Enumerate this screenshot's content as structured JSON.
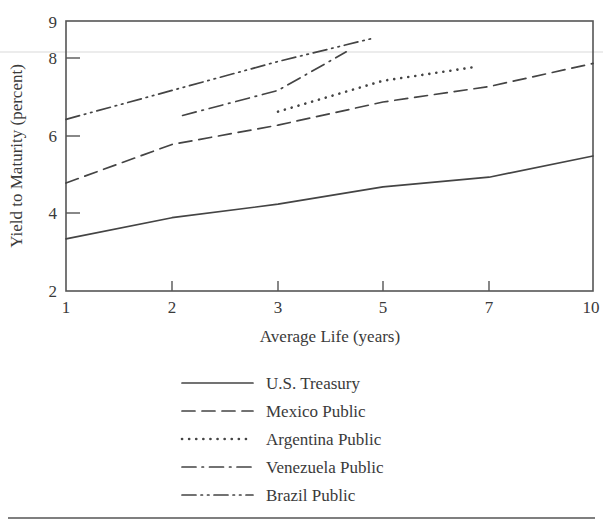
{
  "chart_data": {
    "type": "line",
    "title": "",
    "xlabel": "Average Life (years)",
    "ylabel": "Yield to Maturity (percent)",
    "x_tick_labels": [
      "1",
      "2",
      "3",
      "5",
      "7",
      "10"
    ],
    "x_tick_values": [
      1,
      2,
      3,
      5,
      7,
      10
    ],
    "x_scale": "ordinal-spaced",
    "y_tick_labels": [
      "2",
      "4",
      "6",
      "8",
      "9"
    ],
    "y_tick_values": [
      2,
      4,
      6,
      8,
      9
    ],
    "ylim": [
      2,
      9
    ],
    "grid": false,
    "legend_position": "below-plot",
    "series": [
      {
        "name": "U.S. Treasury",
        "style": "solid",
        "x": [
          1,
          2,
          3,
          5,
          7,
          10
        ],
        "y": [
          3.35,
          3.9,
          4.25,
          4.7,
          4.95,
          5.5
        ]
      },
      {
        "name": "Mexico Public",
        "style": "dashed",
        "x": [
          1,
          2,
          3,
          5,
          7,
          10
        ],
        "y": [
          4.8,
          5.8,
          6.3,
          6.9,
          7.3,
          7.9
        ]
      },
      {
        "name": "Argentina Public",
        "style": "dotted",
        "x": [
          3,
          5,
          6.7
        ],
        "y": [
          6.65,
          7.45,
          7.8
        ]
      },
      {
        "name": "Venezuela Public",
        "style": "dash-dot",
        "x": [
          2.1,
          3,
          4.3
        ],
        "y": [
          6.55,
          7.2,
          8.2
        ]
      },
      {
        "name": "Brazil Public",
        "style": "dash-dot-dot",
        "x": [
          1,
          2,
          3,
          4.8
        ],
        "y": [
          6.45,
          7.2,
          7.95,
          8.55
        ]
      }
    ]
  },
  "legend": {
    "items": [
      {
        "label": "U.S. Treasury",
        "style": "solid"
      },
      {
        "label": "Mexico Public",
        "style": "dashed"
      },
      {
        "label": "Argentina Public",
        "style": "dotted"
      },
      {
        "label": "Venezuela Public",
        "style": "dash-dot"
      },
      {
        "label": "Brazil Public",
        "style": "dash-dot-dot"
      }
    ]
  },
  "axes": {
    "x_title": "Average Life (years)",
    "y_title": "Yield to Maturity (percent)"
  }
}
